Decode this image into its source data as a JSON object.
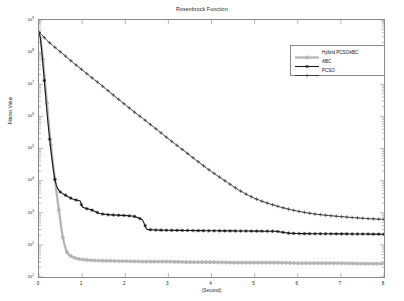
{
  "chart_data": {
    "type": "line",
    "title": "Rosenbrock Function",
    "xlabel": "(Second)",
    "ylabel": "Fitness Value",
    "xlim": [
      0,
      8
    ],
    "ylim": [
      10,
      1000000000
    ],
    "yscale": "log",
    "xscale": "linear",
    "grid": false,
    "legend_position": "upper right",
    "xticks": [
      "0",
      "1",
      "2",
      "3",
      "4",
      "5",
      "6",
      "7",
      "8"
    ],
    "xtick_values": [
      0,
      1,
      2,
      3,
      4,
      5,
      6,
      7,
      8
    ],
    "ytick_labels": [
      "10",
      "10",
      "10",
      "10",
      "10",
      "10",
      "10",
      "10",
      "10"
    ],
    "ytick_exponents": [
      "9",
      "8",
      "7",
      "6",
      "5",
      "4",
      "3",
      "2",
      "1"
    ],
    "ytick_values": [
      1000000000,
      100000000,
      10000000,
      1000000,
      100000,
      10000,
      1000,
      100,
      10
    ],
    "series": [
      {
        "name": "Hybrid PCSOABC",
        "color": "#b3b3b3",
        "marker": "circle",
        "linewidth": 2.2,
        "x": [
          0.02,
          0.08,
          0.14,
          0.2,
          0.26,
          0.32,
          0.36,
          0.4,
          0.44,
          0.48,
          0.52,
          0.56,
          0.6,
          0.64,
          0.7,
          0.8,
          0.9,
          1.0,
          1.2,
          1.5,
          2.0,
          2.5,
          3.0,
          3.5,
          4.0,
          4.5,
          5.0,
          5.5,
          6.0,
          6.5,
          7.0,
          7.5,
          8.0
        ],
        "y": [
          400000000,
          90000000,
          12000000,
          1500000,
          200000,
          40000,
          14000,
          5000,
          2000,
          800,
          320,
          150,
          90,
          62,
          48,
          40,
          37,
          35,
          33,
          32,
          31,
          30,
          30,
          29,
          29,
          28,
          28,
          28,
          27,
          27,
          27,
          26,
          26
        ]
      },
      {
        "name": "ABC",
        "color": "#1a1a1a",
        "marker": "star",
        "linewidth": 1.1,
        "x": [
          0.02,
          0.06,
          0.1,
          0.14,
          0.18,
          0.22,
          0.26,
          0.3,
          0.34,
          0.38,
          0.42,
          0.48,
          0.55,
          0.62,
          0.7,
          0.78,
          0.85,
          0.92,
          0.96,
          1.0,
          1.1,
          1.2,
          1.3,
          1.4,
          1.5,
          1.6,
          1.8,
          2.0,
          2.1,
          2.2,
          2.3,
          2.4,
          2.45,
          2.5,
          2.7,
          3.0,
          3.5,
          4.0,
          4.5,
          5.0,
          5.5,
          5.8,
          6.0,
          6.5,
          7.0,
          7.5,
          8.0
        ],
        "y": [
          400000000,
          120000000,
          30000000,
          7000000,
          1600000,
          420000,
          130000,
          45000,
          18000,
          9000,
          6000,
          4600,
          3900,
          3500,
          3000,
          2700,
          2500,
          2400,
          2300,
          1500,
          1350,
          1250,
          1100,
          950,
          900,
          870,
          840,
          820,
          800,
          780,
          700,
          600,
          430,
          300,
          290,
          285,
          280,
          275,
          272,
          268,
          265,
          230,
          225,
          222,
          220,
          218,
          215
        ]
      },
      {
        "name": "PCSO",
        "color": "#3a3a3a",
        "marker": "plus",
        "linewidth": 1.0,
        "x": [
          0.02,
          0.2,
          0.4,
          0.6,
          0.8,
          1.0,
          1.2,
          1.4,
          1.6,
          1.8,
          2.0,
          2.2,
          2.4,
          2.6,
          2.8,
          3.0,
          3.2,
          3.4,
          3.6,
          3.8,
          4.0,
          4.2,
          4.4,
          4.6,
          4.8,
          5.0,
          5.2,
          5.4,
          5.6,
          5.8,
          6.0,
          6.2,
          6.4,
          6.6,
          6.8,
          7.0,
          7.2,
          7.4,
          7.6,
          7.8,
          8.0
        ],
        "y": [
          400000000,
          220000000,
          130000000,
          78000000,
          46000000,
          28000000,
          17000000,
          10500000,
          6300000,
          3800000,
          2300000,
          1400000,
          880000,
          540000,
          330000,
          200000,
          125000,
          78000,
          48000,
          30000,
          19000,
          12500,
          8200,
          5400,
          3800,
          2800,
          2200,
          1800,
          1500,
          1280,
          1120,
          1000,
          910,
          850,
          800,
          760,
          720,
          690,
          660,
          640,
          620
        ]
      }
    ]
  },
  "legend": {
    "entries": [
      {
        "label": "Hybrid PCSOABC"
      },
      {
        "label": "ABC"
      },
      {
        "label": "PCSO"
      }
    ]
  }
}
